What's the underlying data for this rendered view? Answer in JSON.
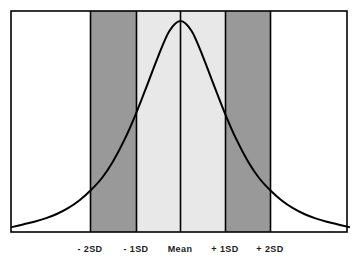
{
  "chart_data": {
    "type": "line",
    "title": "",
    "subtitle": "",
    "xlabel": "",
    "ylabel": "",
    "grid": false,
    "legend": "none",
    "xlim": [
      -3.75,
      3.75
    ],
    "ylim": [
      0,
      1.06
    ],
    "tick_labels": [
      "- 2SD",
      "- 1SD",
      "Mean",
      "+ 1SD",
      "+ 2SD"
    ],
    "tick_values": [
      -2,
      -1,
      0,
      1,
      2
    ],
    "x": [
      -3.75,
      -3.5,
      -3.25,
      -3,
      -2.75,
      -2.5,
      -2.25,
      -2,
      -1.75,
      -1.5,
      -1.25,
      -1,
      -0.75,
      -0.5,
      -0.25,
      0,
      0.25,
      0.5,
      0.75,
      1,
      1.25,
      1.5,
      1.75,
      2,
      2.25,
      2.5,
      2.75,
      3,
      3.25,
      3.5,
      3.75
    ],
    "y": [
      0.009,
      0.022,
      0.035,
      0.051,
      0.072,
      0.1,
      0.137,
      0.185,
      0.244,
      0.325,
      0.427,
      0.549,
      0.687,
      0.828,
      0.951,
      1.0,
      0.951,
      0.828,
      0.687,
      0.549,
      0.427,
      0.325,
      0.244,
      0.185,
      0.137,
      0.1,
      0.072,
      0.051,
      0.035,
      0.022,
      0.009
    ],
    "bands": [
      {
        "name": "below-2sd",
        "from": -3.75,
        "to": -2,
        "fill": "#ffffff",
        "label": "beyond -2SD"
      },
      {
        "name": "minus-2sd-to-minus-1sd",
        "from": -2,
        "to": -1,
        "fill": "#999999",
        "label": "-2SD to -1SD"
      },
      {
        "name": "minus-1sd-to-mean",
        "from": -1,
        "to": 0,
        "fill": "#e8e8e8",
        "label": "-1SD to Mean"
      },
      {
        "name": "mean-to-plus-1sd",
        "from": 0,
        "to": 1,
        "fill": "#e8e8e8",
        "label": "Mean to +1SD"
      },
      {
        "name": "plus-1sd-to-plus-2sd",
        "from": 1,
        "to": 2,
        "fill": "#999999",
        "label": "+1SD to +2SD"
      },
      {
        "name": "above-2sd",
        "from": 2,
        "to": 3.75,
        "fill": "#ffffff",
        "label": "beyond +2SD"
      }
    ]
  },
  "colors": {
    "curve": "#000000",
    "frame": "#000000",
    "divider": "#000000",
    "band_dark": "#999999",
    "band_light": "#e8e8e8",
    "band_white": "#ffffff",
    "label_text": "#1a1a1a",
    "background": "#ffffff"
  },
  "labels": [
    {
      "id": "minus-2sd",
      "text": "- 2SD",
      "x_px": 90
    },
    {
      "id": "minus-1sd",
      "text": "- 1SD",
      "x_px": 136
    },
    {
      "id": "mean",
      "text": "Mean",
      "x_px": 180
    },
    {
      "id": "plus-1sd",
      "text": "+ 1SD",
      "x_px": 225
    },
    {
      "id": "plus-2sd",
      "text": "+ 2SD",
      "x_px": 270
    }
  ]
}
